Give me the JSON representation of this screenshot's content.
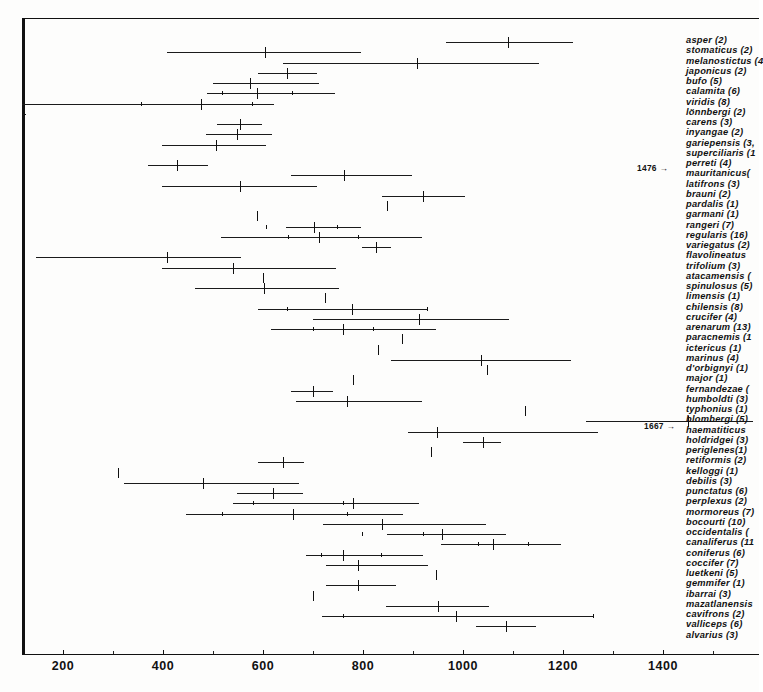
{
  "chart_data": {
    "type": "scatter",
    "title": "",
    "xlabel": "",
    "ylabel": "",
    "xlim": [
      130,
      1580
    ],
    "xticks": [
      200,
      400,
      600,
      800,
      1000,
      1200,
      1400
    ],
    "xticklabels": [
      "200",
      "400",
      "600",
      "800",
      "1000",
      "1200",
      "1400"
    ],
    "minor_xticks": [
      300,
      500,
      700,
      900,
      1100,
      1300,
      1500
    ],
    "grid": false,
    "legend": "none",
    "orientation": "horizontal-range-rows",
    "annotations": [
      {
        "text": "1476 →",
        "row": "superciliaris",
        "x_px": 637,
        "y_px": 163
      },
      {
        "text": "1667 →",
        "row": "blombergi",
        "x_px": 644,
        "y_px": 421
      }
    ],
    "rows": [
      {
        "label": "asper (2)",
        "min": 966,
        "max": 1220,
        "mean": 1090,
        "sd": []
      },
      {
        "label": "stomaticus (2)",
        "min": 408,
        "max": 795,
        "mean": 603,
        "sd": []
      },
      {
        "label": "melanostictus (4",
        "min": 640,
        "max": 1152,
        "mean": 907,
        "sd": []
      },
      {
        "label": "japonicus (2)",
        "min": 590,
        "max": 708,
        "mean": 648,
        "sd": []
      },
      {
        "label": "bufo (5)",
        "min": 500,
        "max": 712,
        "mean": 574,
        "sd": []
      },
      {
        "label": "calamita (6)",
        "min": 488,
        "max": 744,
        "mean": 588,
        "sd": [
          518,
          658
        ]
      },
      {
        "label": "viridis (8)",
        "min": 118,
        "max": 622,
        "mean": 476,
        "sd": [
          356,
          578
        ]
      },
      {
        "label": "lönnbergi (2)",
        "min": 120,
        "max": 125,
        "mean": 122,
        "sd": [],
        "isolated": true
      },
      {
        "label": "carens (3)",
        "min": 508,
        "max": 598,
        "mean": 553,
        "sd": []
      },
      {
        "label": "inyangae (2)",
        "min": 485,
        "max": 618,
        "mean": 548,
        "sd": []
      },
      {
        "label": "gariepensis (3,",
        "min": 398,
        "max": 605,
        "mean": 506,
        "sd": []
      },
      {
        "label": "superciliaris (1",
        "min": 0,
        "max": 0,
        "mean": 0,
        "sd": [],
        "arrow": "1476 →"
      },
      {
        "label": "perreti (4)",
        "min": 370,
        "max": 490,
        "mean": 428,
        "sd": []
      },
      {
        "label": "mauritanicus(",
        "min": 655,
        "max": 898,
        "mean": 762,
        "sd": []
      },
      {
        "label": "latifrons (3)",
        "min": 398,
        "max": 708,
        "mean": 554,
        "sd": []
      },
      {
        "label": "brauni (2)",
        "min": 838,
        "max": 1003,
        "mean": 920,
        "sd": []
      },
      {
        "label": "pardalis (1)",
        "min": 847,
        "max": 847,
        "mean": 847,
        "sd": [],
        "single": true
      },
      {
        "label": "garmani (1)",
        "min": 588,
        "max": 588,
        "mean": 588,
        "sd": [],
        "single": true
      },
      {
        "label": "rangeri (7)",
        "min": 645,
        "max": 795,
        "mean": 702,
        "sd": [
          605,
          748
        ]
      },
      {
        "label": "regularis (16)",
        "min": 515,
        "max": 918,
        "mean": 712,
        "sd": [
          650,
          790
        ]
      },
      {
        "label": "variegatus (2)",
        "min": 798,
        "max": 855,
        "mean": 825,
        "sd": []
      },
      {
        "label": "flavolineatus",
        "min": 145,
        "max": 555,
        "mean": 408,
        "sd": []
      },
      {
        "label": "trifolium (3)",
        "min": 398,
        "max": 745,
        "mean": 540,
        "sd": []
      },
      {
        "label": "atacamensis (",
        "min": 455,
        "max": 655,
        "mean": 600,
        "sd": [],
        "single": true
      },
      {
        "label": "spinulosus (5)",
        "min": 463,
        "max": 752,
        "mean": 602,
        "sd": []
      },
      {
        "label": "limensis (1)",
        "min": 723,
        "max": 723,
        "mean": 723,
        "sd": [],
        "single": true
      },
      {
        "label": "chilensis (8)",
        "min": 590,
        "max": 930,
        "mean": 778,
        "sd": [
          648,
          928
        ]
      },
      {
        "label": "crucifer (4)",
        "min": 700,
        "max": 1092,
        "mean": 912,
        "sd": []
      },
      {
        "label": "arenarum (13)",
        "min": 615,
        "max": 945,
        "mean": 760,
        "sd": [
          700,
          820
        ]
      },
      {
        "label": "paracnemis (1",
        "min": 878,
        "max": 878,
        "mean": 878,
        "sd": [],
        "single": true
      },
      {
        "label": "ictericus (1)",
        "min": 830,
        "max": 830,
        "mean": 830,
        "sd": [],
        "single": true
      },
      {
        "label": "marinus (4)",
        "min": 855,
        "max": 1215,
        "mean": 1035,
        "sd": []
      },
      {
        "label": "d'orbignyi (1)",
        "min": 1048,
        "max": 1048,
        "mean": 1048,
        "sd": [],
        "single": true
      },
      {
        "label": "major (1)",
        "min": 780,
        "max": 780,
        "mean": 780,
        "sd": [],
        "single": true
      },
      {
        "label": "fernandezae (",
        "min": 655,
        "max": 740,
        "mean": 700,
        "sd": []
      },
      {
        "label": "humboldti (3)",
        "min": 665,
        "max": 918,
        "mean": 768,
        "sd": []
      },
      {
        "label": "typhonius (1)",
        "min": 1123,
        "max": 1123,
        "mean": 1123,
        "sd": [],
        "single": true
      },
      {
        "label": "blombergi (5)",
        "min": 1245,
        "max": 1580,
        "mean": 1450,
        "sd": [],
        "arrow": "1667 →"
      },
      {
        "label": "haematiticus",
        "min": 890,
        "max": 1270,
        "mean": 948,
        "sd": []
      },
      {
        "label": "holdridgei (3)",
        "min": 1000,
        "max": 1075,
        "mean": 1040,
        "sd": []
      },
      {
        "label": "periglenes(1)",
        "min": 935,
        "max": 935,
        "mean": 935,
        "sd": [],
        "single": true
      },
      {
        "label": "retiformis (2)",
        "min": 590,
        "max": 682,
        "mean": 640,
        "sd": []
      },
      {
        "label": "kelloggi (1)",
        "min": 310,
        "max": 310,
        "mean": 310,
        "sd": [],
        "single": true
      },
      {
        "label": "debilis (3)",
        "min": 322,
        "max": 672,
        "mean": 480,
        "sd": []
      },
      {
        "label": "punctatus (6)",
        "min": 548,
        "max": 680,
        "mean": 620,
        "sd": []
      },
      {
        "label": "perplexus (2)",
        "min": 540,
        "max": 912,
        "mean": 780,
        "sd": [
          580,
          760
        ]
      },
      {
        "label": "mormoreus (7)",
        "min": 445,
        "max": 880,
        "mean": 660,
        "sd": [
          518,
          768
        ]
      },
      {
        "label": "bocourti (10)",
        "min": 720,
        "max": 1045,
        "mean": 838,
        "sd": []
      },
      {
        "label": "occidentalis (",
        "min": 848,
        "max": 1085,
        "mean": 958,
        "sd": [
          798,
          920
        ]
      },
      {
        "label": "canaliferus (11",
        "min": 955,
        "max": 1195,
        "mean": 1060,
        "sd": [
          1030,
          1130
        ]
      },
      {
        "label": "coniferus (6)",
        "min": 686,
        "max": 920,
        "mean": 760,
        "sd": [
          715,
          835
        ]
      },
      {
        "label": "coccifer (7)",
        "min": 725,
        "max": 930,
        "mean": 790,
        "sd": []
      },
      {
        "label": "luetkeni (5)",
        "min": 945,
        "max": 945,
        "mean": 945,
        "sd": [],
        "single": true
      },
      {
        "label": "gemmifer (1)",
        "min": 725,
        "max": 865,
        "mean": 790,
        "sd": []
      },
      {
        "label": "ibarrai (3)",
        "min": 700,
        "max": 700,
        "mean": 700,
        "sd": [],
        "single": true
      },
      {
        "label": "mazatlanensis",
        "min": 845,
        "max": 1052,
        "mean": 950,
        "sd": []
      },
      {
        "label": "cavifrons (2)",
        "min": 718,
        "max": 1260,
        "mean": 985,
        "sd": [
          760,
          1260
        ]
      },
      {
        "label": "valliceps (6)",
        "min": 1025,
        "max": 1145,
        "mean": 1085,
        "sd": []
      },
      {
        "label": "alvarius (3)",
        "min": 0,
        "max": 0,
        "mean": 0,
        "sd": [],
        "blank": true
      }
    ]
  },
  "axis": {
    "tick_labels": [
      "200",
      "400",
      "600",
      "800",
      "1000",
      "1200",
      "1400"
    ]
  }
}
